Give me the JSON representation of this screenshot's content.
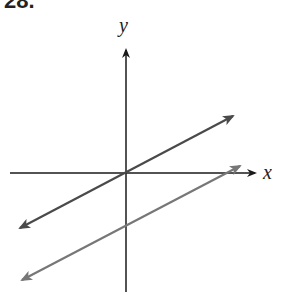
{
  "problem": {
    "number": "28."
  },
  "axes": {
    "x_label": "x",
    "y_label": "y"
  },
  "colors": {
    "axis": "#1a1a1a",
    "line1": "#4a4a4a",
    "line2": "#777777"
  },
  "lines": [
    {
      "name": "line-through-origin",
      "description": "line through origin with positive slope, arrows both ends"
    },
    {
      "name": "parallel-line-below",
      "description": "parallel line shifted down, arrows both ends"
    }
  ]
}
